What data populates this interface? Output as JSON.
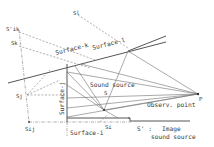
{
  "diagram": {
    "labels": {
      "s_ik": "S'ik",
      "s_k": "Sk",
      "s_j": "Sj",
      "s_ij": "Sij",
      "s_i": "Si",
      "s_l": "Sl",
      "s_source": "S",
      "p": "P",
      "surface_k": "Surface-k",
      "surface_l": "Surface-l",
      "surface_j": "Surface-j",
      "surface_i": "Surface-i",
      "sound_source": "Sound source",
      "observ_point": "Observ. point",
      "image_marker": "S' :",
      "image_source_line1": "Image",
      "image_source_line2": "sound source"
    },
    "colors": {
      "line": "#5a5a5a",
      "text": "#3a3a3a",
      "background": "#ffffff"
    }
  }
}
